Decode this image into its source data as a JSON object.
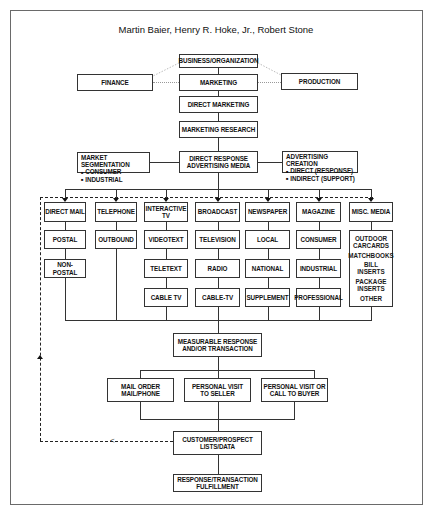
{
  "authors": "Martin Baier, Henry R. Hoke, Jr., Robert Stone",
  "top": {
    "business": "BUSINESS/ORGANIZATION",
    "finance": "FINANCE",
    "marketing": "MARKETING",
    "production": "PRODUCTION",
    "direct_marketing": "DIRECT MARKETING",
    "marketing_research": "MARKETING RESEARCH",
    "drm_line1": "DIRECT RESPONSE",
    "drm_line2": "ADVERTISING MEDIA"
  },
  "segmentation": {
    "title": "MARKET SEGMENTATION",
    "items": [
      "CONSUMER",
      "INDUSTRIAL"
    ]
  },
  "creation": {
    "title": "ADVERTISING CREATION",
    "items": [
      "DIRECT (RESPONSE)",
      "INDIRECT (SUPPORT)"
    ]
  },
  "media": [
    {
      "header": "DIRECT MAIL",
      "items": [
        "POSTAL",
        "NON-POSTAL"
      ]
    },
    {
      "header": "TELEPHONE",
      "items": [
        "OUTBOUND"
      ]
    },
    {
      "header_line1": "INTERACTIVE",
      "header_line2": "TV",
      "items": [
        "VIDEOTEXT",
        "TELETEXT",
        "CABLE TV"
      ]
    },
    {
      "header": "BROADCAST",
      "items": [
        "TELEVISION",
        "RADIO",
        "CABLE-TV"
      ]
    },
    {
      "header": "NEWSPAPER",
      "items": [
        "LOCAL",
        "NATIONAL",
        "SUPPLEMENT"
      ]
    },
    {
      "header": "MAGAZINE",
      "items": [
        "CONSUMER",
        "INDUSTRIAL",
        "PROFESSIONAL"
      ]
    },
    {
      "header": "MISC. MEDIA",
      "items": [
        "OUTDOOR",
        "CARCARDS",
        "MATCHBOOKS",
        "BILL INSERTS",
        "PACKAGE",
        "INSERTS",
        "OTHER"
      ]
    }
  ],
  "bottom": {
    "measurable_line1": "MEASURABLE RESPONSE",
    "measurable_line2": "AND/OR TRANSACTION",
    "mail_order_line1": "MAIL ORDER",
    "mail_order_line2": "MAIL/PHONE",
    "visit_seller_line1": "PERSONAL VISIT",
    "visit_seller_line2": "TO SELLER",
    "visit_buyer_line1": "PERSONAL VISIT OR",
    "visit_buyer_line2": "CALL TO BUYER",
    "lists_line1": "CUSTOMER/PROSPECT",
    "lists_line2": "LISTS/DATA",
    "fulfillment_line1": "RESPONSE/TRANSACTION",
    "fulfillment_line2": "FULFILLMENT"
  }
}
